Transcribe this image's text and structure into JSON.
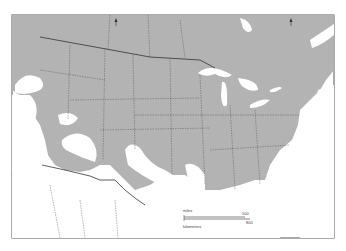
{
  "map": {
    "type": "species range map",
    "region": "North America (United States, southern Canada, northern Mexico)",
    "colors": {
      "range_fill": "#b3b3b3",
      "non_range": "#ffffff",
      "water": "#ffffff",
      "boundary": "#333333",
      "frame": "#555555"
    },
    "scale_bar": {
      "top_label": "miles",
      "top_start": "0",
      "top_end": "500",
      "bottom_label": "kilometers",
      "bottom_start": "0",
      "bottom_end": "800"
    },
    "north_arrows": 2
  }
}
